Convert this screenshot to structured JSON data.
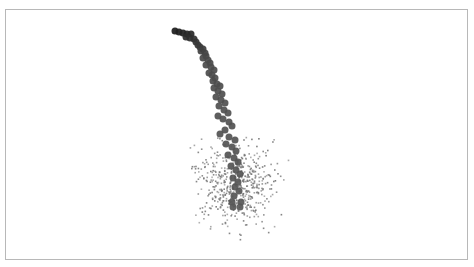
{
  "chart_data": {
    "type": "scatter",
    "title": "",
    "xlabel": "",
    "ylabel": "",
    "grid": false,
    "legend": null,
    "axes_visible": false,
    "frame": {
      "x": 5,
      "y": 9,
      "width": 463,
      "height": 251,
      "stroke": "#b8b8b8"
    },
    "series": [
      {
        "name": "trajectory",
        "marker": "circle",
        "marker_size_px": 7,
        "color_gradient": [
          "#1c1c1c",
          "#4a4a4a",
          "#575757"
        ],
        "points": [
          [
            175,
            31
          ],
          [
            179,
            32
          ],
          [
            183,
            33
          ],
          [
            187,
            34
          ],
          [
            191,
            34
          ],
          [
            186,
            37
          ],
          [
            190,
            38
          ],
          [
            194,
            39
          ],
          [
            196,
            42
          ],
          [
            198,
            45
          ],
          [
            200,
            47
          ],
          [
            203,
            49
          ],
          [
            201,
            51
          ],
          [
            205,
            53
          ],
          [
            206,
            56
          ],
          [
            203,
            58
          ],
          [
            208,
            60
          ],
          [
            210,
            63
          ],
          [
            206,
            65
          ],
          [
            211,
            67
          ],
          [
            214,
            70
          ],
          [
            209,
            73
          ],
          [
            212,
            75
          ],
          [
            215,
            78
          ],
          [
            213,
            81
          ],
          [
            217,
            84
          ],
          [
            220,
            86
          ],
          [
            214,
            88
          ],
          [
            218,
            91
          ],
          [
            222,
            94
          ],
          [
            216,
            97
          ],
          [
            221,
            100
          ],
          [
            225,
            103
          ],
          [
            219,
            106
          ],
          [
            224,
            110
          ],
          [
            228,
            113
          ],
          [
            218,
            116
          ],
          [
            223,
            119
          ],
          [
            229,
            122
          ],
          [
            232,
            126
          ],
          [
            225,
            130
          ],
          [
            220,
            134
          ],
          [
            229,
            137
          ],
          [
            235,
            140
          ],
          [
            226,
            144
          ],
          [
            232,
            147
          ],
          [
            236,
            151
          ],
          [
            228,
            155
          ],
          [
            234,
            158
          ],
          [
            238,
            162
          ],
          [
            231,
            166
          ],
          [
            236,
            170
          ],
          [
            240,
            174
          ],
          [
            233,
            178
          ],
          [
            238,
            182
          ],
          [
            235,
            187
          ],
          [
            239,
            191
          ],
          [
            234,
            196
          ],
          [
            232,
            202
          ],
          [
            241,
            202
          ],
          [
            233,
            207
          ],
          [
            240,
            207
          ]
        ]
      },
      {
        "name": "samples",
        "marker": "dot",
        "marker_size_px": 1.6,
        "color": "#777777",
        "count": 520,
        "center": [
          234,
          183
        ],
        "spread_x": [
          188,
          288
        ],
        "spread_y": [
          135,
          240
        ]
      }
    ]
  }
}
